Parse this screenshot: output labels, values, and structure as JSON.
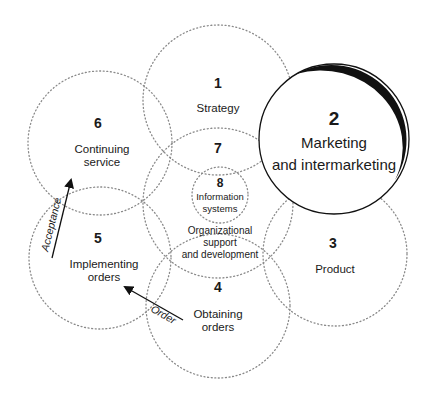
{
  "diagram": {
    "circles": [
      {
        "id": 1,
        "number": "1",
        "lines": [
          "Strategy"
        ],
        "cx": 218,
        "cy": 100,
        "r": 75,
        "style": "dotted"
      },
      {
        "id": 2,
        "number": "2",
        "lines": [
          "Marketing",
          "and intermarketing"
        ],
        "cx": 334,
        "cy": 139,
        "r": 75,
        "style": "solid-emphasis"
      },
      {
        "id": 3,
        "number": "3",
        "lines": [
          "Product"
        ],
        "cx": 335,
        "cy": 254,
        "r": 72,
        "style": "dotted"
      },
      {
        "id": 4,
        "number": "4",
        "lines": [
          "Obtaining",
          "orders"
        ],
        "cx": 218,
        "cy": 306,
        "r": 72,
        "style": "dotted"
      },
      {
        "id": 5,
        "number": "5",
        "lines": [
          "Implementing",
          "orders"
        ],
        "cx": 100,
        "cy": 258,
        "r": 71,
        "style": "dotted"
      },
      {
        "id": 6,
        "number": "6",
        "lines": [
          "Continuing",
          "service"
        ],
        "cx": 100,
        "cy": 143,
        "r": 72,
        "style": "dotted"
      },
      {
        "id": 7,
        "number": "7",
        "lines": [
          "Organizational",
          "support",
          "and development"
        ],
        "cx": 218,
        "cy": 203,
        "r": 75,
        "style": "dotted"
      },
      {
        "id": 8,
        "number": "8",
        "lines": [
          "Information",
          "systems"
        ],
        "cx": 220,
        "cy": 195,
        "r": 28,
        "style": "dotted"
      }
    ],
    "arrows": [
      {
        "label": "Acceptance",
        "from": [
          52,
          258
        ],
        "to": [
          72,
          177
        ]
      },
      {
        "label": "Order",
        "from": [
          183,
          320
        ],
        "to": [
          122,
          285
        ]
      }
    ],
    "colors": {
      "stroke": "#1a1a1a",
      "dotted": "#8a8a8a",
      "background": "#ffffff"
    }
  }
}
